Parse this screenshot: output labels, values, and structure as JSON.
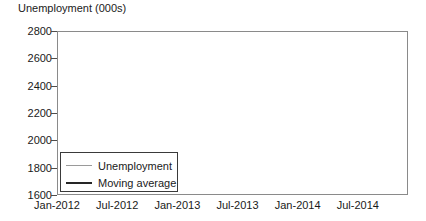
{
  "chart_data": {
    "type": "line",
    "title": "Unemployment (000s)",
    "xlabel": "",
    "ylabel": "",
    "ylim": [
      1600,
      2800
    ],
    "yticks": [
      1600,
      1800,
      2000,
      2200,
      2400,
      2600,
      2800
    ],
    "grid": true,
    "grid_style": "dashed-horizontal",
    "legend_position": "bottom-left",
    "x": [
      "Jan-2012",
      "Feb-2012",
      "Mar-2012",
      "Apr-2012",
      "May-2012",
      "Jun-2012",
      "Jul-2012",
      "Aug-2012",
      "Sep-2012",
      "Oct-2012",
      "Nov-2012",
      "Dec-2012",
      "Jan-2013",
      "Feb-2013",
      "Mar-2013",
      "Apr-2013",
      "May-2013",
      "Jun-2013",
      "Jul-2013",
      "Aug-2013",
      "Sep-2013",
      "Oct-2013",
      "Nov-2013",
      "Dec-2013",
      "Jan-2014",
      "Feb-2014",
      "Mar-2014",
      "Apr-2014",
      "May-2014",
      "Jun-2014",
      "Jul-2014",
      "Aug-2014",
      "Sep-2014",
      "Oct-2014",
      "Nov-2014",
      "Dec-2014"
    ],
    "xticks": [
      "Jan-2012",
      "Jul-2012",
      "Jan-2013",
      "Jul-2013",
      "Jan-2014",
      "Jul-2014"
    ],
    "xtick_indices": [
      0,
      6,
      12,
      18,
      24,
      30
    ],
    "series": [
      {
        "name": "Unemployment",
        "color": "#9a9a9a",
        "width": 1.1,
        "values": [
          2600,
          2605,
          2600,
          2520,
          2440,
          2450,
          2480,
          2540,
          2570,
          2575,
          2560,
          2520,
          2440,
          2435,
          2460,
          2520,
          2500,
          2440,
          2420,
          2470,
          2555,
          2560,
          2545,
          2450,
          2340,
          2230,
          2120,
          2045,
          2040,
          2035,
          2055,
          2060,
          2030,
          1930,
          1790,
          1780
        ]
      },
      {
        "name": "Moving average",
        "color": "#262626",
        "width": 2.2,
        "values": [
          2600,
          2580,
          2560,
          2545,
          2532,
          2522,
          2515,
          2508,
          2502,
          2498,
          2495,
          2492,
          2490,
          2488,
          2487,
          2486,
          2486,
          2487,
          2488,
          2486,
          2478,
          2462,
          2438,
          2405,
          2362,
          2310,
          2252,
          2192,
          2132,
          2075,
          2020,
          1972,
          1930,
          1898,
          1878,
          1870
        ]
      }
    ]
  },
  "legend": {
    "items": [
      {
        "label": "Unemployment"
      },
      {
        "label": "Moving average"
      }
    ]
  }
}
